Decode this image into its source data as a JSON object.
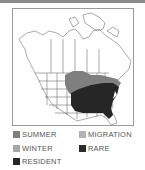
{
  "map": {
    "title": "Range map",
    "colors": {
      "summer": "#7f7f7f",
      "winter": "#a6a6a6",
      "migration": "#b3b3b3",
      "rare": "#2a2a2a",
      "resident": "#262626",
      "border": "#9a9a9a",
      "lines": "#555555"
    }
  },
  "legend": {
    "items": [
      {
        "key": "summer",
        "label": "SUMMER",
        "color": "#7f7f7f"
      },
      {
        "key": "migration",
        "label": "MIGRATION",
        "color": "#b3b3b3"
      },
      {
        "key": "winter",
        "label": "WINTER",
        "color": "#a6a6a6"
      },
      {
        "key": "rare",
        "label": "RARE",
        "color": "#2a2a2a"
      },
      {
        "key": "resident",
        "label": "RESIDENT",
        "color": "#262626"
      }
    ]
  }
}
